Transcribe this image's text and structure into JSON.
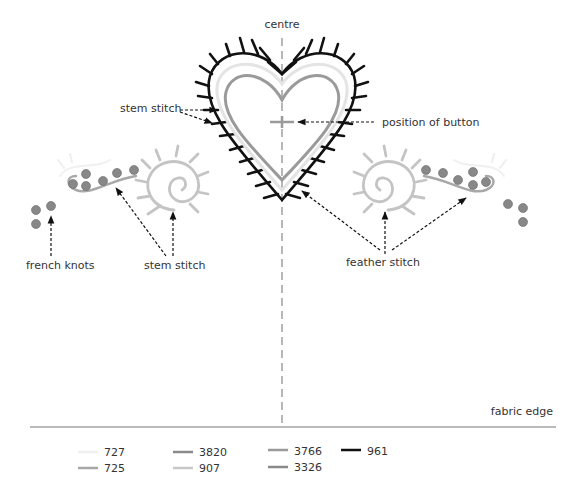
{
  "labels": {
    "centre": "centre",
    "stem_stitch_heart": "stem stitch",
    "position_of_button": "position of button",
    "french_knots": "french knots",
    "stem_stitch_left": "stem stitch",
    "feather_stitch": "feather stitch",
    "fabric_edge": "fabric edge"
  },
  "legend": [
    {
      "code": "727",
      "color": "#f0f0f0"
    },
    {
      "code": "725",
      "color": "#a8a8a8"
    },
    {
      "code": "3820",
      "color": "#8a8a8a"
    },
    {
      "code": "907",
      "color": "#c8c8c8"
    },
    {
      "code": "3766",
      "color": "#9a9a9a"
    },
    {
      "code": "3326",
      "color": "#8a8a8a"
    },
    {
      "code": "961",
      "color": "#111111"
    }
  ],
  "colors": {
    "outline_961": "#111111",
    "heart_inner_3766": "#9a9a9a",
    "heart_mid_727": "#e6e6e6",
    "feather_907": "#c4c4c4",
    "knots": "#888888",
    "centre_line": "#888888"
  }
}
